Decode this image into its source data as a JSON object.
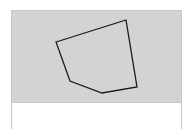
{
  "canvas": {
    "background": "#d3d3d3",
    "stroke": "#1a1a1a",
    "polygon_points": "44,31 114,9 125,76 90,82 58,70"
  },
  "panel": {
    "background": "#ffffff"
  }
}
